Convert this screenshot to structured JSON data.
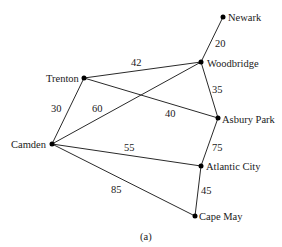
{
  "caption": "(a)",
  "nodes": {
    "newark": {
      "label": "Newark",
      "x": 223,
      "y": 17
    },
    "woodbridge": {
      "label": "Woodbridge",
      "x": 201,
      "y": 62
    },
    "trenton": {
      "label": "Trenton",
      "x": 84,
      "y": 78
    },
    "asbury_park": {
      "label": "Asbury Park",
      "x": 218,
      "y": 118
    },
    "camden": {
      "label": "Camden",
      "x": 52,
      "y": 144
    },
    "atlantic_city": {
      "label": "Atlantic City",
      "x": 201,
      "y": 166
    },
    "cape_may": {
      "label": "Cape May",
      "x": 195,
      "y": 216
    }
  },
  "edges": [
    {
      "from": "newark",
      "to": "woodbridge",
      "weight": "20"
    },
    {
      "from": "trenton",
      "to": "woodbridge",
      "weight": "42"
    },
    {
      "from": "woodbridge",
      "to": "asbury_park",
      "weight": "35"
    },
    {
      "from": "trenton",
      "to": "asbury_park",
      "weight": "40"
    },
    {
      "from": "trenton",
      "to": "camden",
      "weight": "30"
    },
    {
      "from": "camden",
      "to": "woodbridge",
      "weight": "60"
    },
    {
      "from": "camden",
      "to": "atlantic_city",
      "weight": "55"
    },
    {
      "from": "asbury_park",
      "to": "atlantic_city",
      "weight": "75"
    },
    {
      "from": "camden",
      "to": "cape_may",
      "weight": "85"
    },
    {
      "from": "atlantic_city",
      "to": "cape_may",
      "weight": "45"
    }
  ]
}
